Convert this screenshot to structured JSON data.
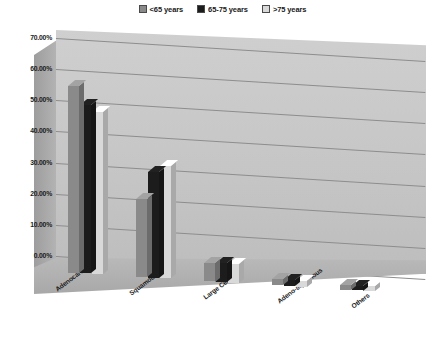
{
  "legend": {
    "position": "top-center",
    "items": [
      {
        "label": "<65 years",
        "color": "#8a8a8a"
      },
      {
        "label": "65-75 years",
        "color": "#1c1c1c"
      },
      {
        "label": ">75 years",
        "color": "#d9d9d9"
      }
    ]
  },
  "chart_data": {
    "type": "bar",
    "title": "",
    "subtitle": "",
    "xlabel": "",
    "ylabel": "",
    "grid": true,
    "legend_position": "top-center",
    "ylim": [
      0,
      70
    ],
    "yticks": [
      "0.00%",
      "10.00%",
      "20.00%",
      "30.00%",
      "40.00%",
      "50.00%",
      "60.00%",
      "70.00%"
    ],
    "ytick_values": [
      0,
      10,
      20,
      30,
      40,
      50,
      60,
      70
    ],
    "categories": [
      "Adenocarcinoma",
      "Squamous Cell",
      "Large Cell",
      "Adeno-squamous",
      "Others"
    ],
    "series": [
      {
        "name": "<65 years",
        "color": "#8a8a8a",
        "values": [
          60.0,
          25.0,
          6.0,
          2.0,
          1.5
        ]
      },
      {
        "name": "65-75 years",
        "color": "#1c1c1c",
        "values": [
          54.0,
          34.0,
          6.0,
          2.0,
          1.5
        ]
      },
      {
        "name": ">75 years",
        "color": "#d9d9d9",
        "values": [
          52.0,
          36.0,
          6.0,
          2.0,
          1.5
        ]
      }
    ]
  }
}
